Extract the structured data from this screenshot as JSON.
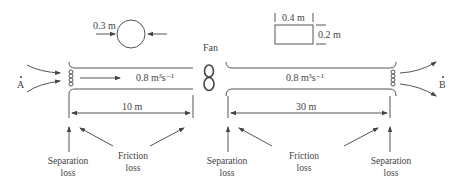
{
  "diagram": {
    "type": "duct-system-schematic",
    "circular_duct": {
      "diameter_label": "0.3 m"
    },
    "rectangular_duct": {
      "width_label": "0.4 m",
      "height_label": "0.2 m"
    },
    "fan": {
      "label": "Fan"
    },
    "points": {
      "inlet": "A",
      "outlet": "B"
    },
    "left_section": {
      "flow_label": "0.8 m³s⁻¹",
      "length_label": "10 m"
    },
    "right_section": {
      "flow_label": "0.8 m³s⁻¹",
      "length_label": "30 m"
    },
    "losses": [
      {
        "line1": "Separation",
        "line2": "loss"
      },
      {
        "line1": "Friction",
        "line2": "loss"
      },
      {
        "line1": "Separation",
        "line2": "loss"
      },
      {
        "line1": "Friction",
        "line2": "loss"
      },
      {
        "line1": "Separation",
        "line2": "loss"
      }
    ]
  }
}
